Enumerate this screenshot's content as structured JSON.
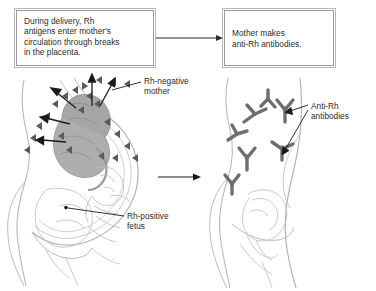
{
  "figure": {
    "background_color": "#ffffff"
  },
  "boxes": [
    {
      "id": "delivery",
      "name": "During delivery box",
      "text": "During delivery, Rh\nantigens enter mother's\ncirculation through breaks\nin the placenta.",
      "border_color": "#9b9b9b",
      "fill_color": "#ffffff"
    },
    {
      "id": "antibodies",
      "name": "Mother makes antibodies box",
      "text": "Mother makes\nanti-Rh antibodies.",
      "border_color": "#9b9b9b",
      "fill_color": "#ffffff"
    }
  ],
  "labels": [
    {
      "id": "rh-negative-mother",
      "text": "Rh-negative\nmother",
      "points_to": "maternal-circulation-left-figure"
    },
    {
      "id": "rh-positive-fetus",
      "text": "Rh-positive\nfetus",
      "points_to": "fetus-left-figure"
    },
    {
      "id": "anti-rh-antibodies",
      "text": "Anti-Rh\nantibodies",
      "points_to": "antibody-symbols-right-figure"
    }
  ],
  "connectors": [
    {
      "id": "box-to-box-arrow",
      "from": "delivery box",
      "to": "antibodies box",
      "direction": "right"
    },
    {
      "id": "figure-to-figure-arrow",
      "from": "pregnant figure",
      "to": "post-delivery figure",
      "direction": "right"
    }
  ],
  "illustration": {
    "left_figure": {
      "name": "pregnant-woman-profile",
      "contains": [
        "uterus",
        "placenta",
        "fetus",
        "rh-antigen-triangles",
        "antigen-escape-arrows"
      ],
      "antigen_count": 22,
      "antigen_color": "#5a5a5a",
      "placenta_color": "#a8a8a8",
      "outline_color": "#b3b3b3"
    },
    "right_figure": {
      "name": "post-delivery-woman-profile",
      "contains": [
        "uterus-involuted",
        "anti-rh-antibody-symbols"
      ],
      "antibody_count": 7,
      "antibody_color": "#6e6e6e",
      "outline_color": "#b3b3b3"
    }
  },
  "colors": {
    "text": "#2b2b2b",
    "line_dark": "#1a1a1a",
    "line_light": "#b3b3b3",
    "antigen": "#5a5a5a",
    "antibody": "#6e6e6e",
    "placenta": "#a8a8a8"
  }
}
